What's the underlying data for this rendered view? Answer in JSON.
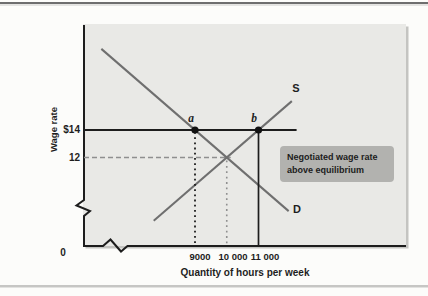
{
  "figure": {
    "y_axis_title": "Wage rate",
    "x_axis_title": "Quantity of hours per week",
    "origin_label": "0",
    "y_tick_labels": [
      "$14",
      "12"
    ],
    "x_tick_labels": [
      "9000",
      "10 000",
      "11 000"
    ],
    "curve_labels": {
      "supply": "S",
      "demand": "D"
    },
    "point_labels": {
      "a": "a",
      "b": "b"
    },
    "annotation_lines": [
      "Negotiated wage rate",
      "above equilibrium"
    ]
  },
  "chart_data": {
    "type": "line",
    "title": "Negotiated wage rate above equilibrium",
    "xlabel": "Quantity of hours per week",
    "ylabel": "Wage rate",
    "x_ticks": [
      9000,
      10000,
      11000
    ],
    "y_ticks": [
      14,
      12
    ],
    "axis_breaks": true,
    "series": [
      {
        "name": "S",
        "role": "supply",
        "points": [
          [
            7700,
            7.4
          ],
          [
            12050,
            16.1
          ]
        ]
      },
      {
        "name": "D",
        "role": "demand",
        "points": [
          [
            6050,
            19.9
          ],
          [
            11950,
            8.1
          ]
        ]
      }
    ],
    "equilibrium": {
      "quantity": 10000,
      "wage": 12
    },
    "negotiated_wage_rate": 14,
    "negotiated_line_extent_q": 12200,
    "labeled_points": [
      {
        "label": "a",
        "quantity": 9000,
        "wage": 14,
        "guide": "dotted"
      },
      {
        "label": "b",
        "quantity": 11000,
        "wage": 14,
        "guide": "solid"
      }
    ],
    "annotation": "Negotiated wage rate above equilibrium"
  },
  "colors": {
    "panel_bg": "#e9e9e6",
    "axis": "#1d1d1d",
    "curve": "#6f6f6f",
    "guide_gray": "#8f8f8f",
    "point_fill": "#111111",
    "annotation_bg": "#b2b2af",
    "text": "#1e1e1e"
  }
}
